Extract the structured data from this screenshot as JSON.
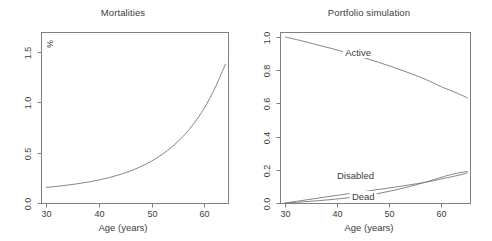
{
  "figure": {
    "background_color": "#ffffff",
    "axis_color": "#808080",
    "curve_color": "#787878",
    "text_color": "#3c3c3c"
  },
  "chart_data": [
    {
      "type": "line",
      "title": "Mortalities",
      "xlabel": "Age (years)",
      "ylabel": "%",
      "unit_label": "%",
      "xlim": [
        29,
        64.5
      ],
      "ylim": [
        0.0,
        1.7
      ],
      "grid": false,
      "legend": "none",
      "xticks": [
        30,
        40,
        50,
        60
      ],
      "xticklabels": [
        "30",
        "40",
        "50",
        "60"
      ],
      "yticks": [
        0.0,
        0.5,
        1.0,
        1.5
      ],
      "yticklabels": [
        "0.0",
        "0.5",
        "1.0",
        "1.5"
      ],
      "series": [
        {
          "name": "mortality",
          "x": [
            30,
            32,
            34,
            36,
            38,
            40,
            42,
            44,
            46,
            48,
            50,
            52,
            54,
            56,
            58,
            60,
            62,
            64
          ],
          "y": [
            0.155,
            0.165,
            0.178,
            0.192,
            0.209,
            0.229,
            0.253,
            0.283,
            0.319,
            0.363,
            0.417,
            0.483,
            0.564,
            0.664,
            0.789,
            0.944,
            1.14,
            1.38
          ]
        }
      ]
    },
    {
      "type": "line",
      "title": "Portfolio simulation",
      "xlabel": "Age (years)",
      "ylabel": "",
      "xlim": [
        29,
        65.5
      ],
      "ylim": [
        0.0,
        1.03
      ],
      "grid": false,
      "legend": "inline-annotations",
      "xticks": [
        30,
        40,
        50,
        60
      ],
      "xticklabels": [
        "30",
        "40",
        "50",
        "60"
      ],
      "yticks": [
        0.0,
        0.2,
        0.4,
        0.6,
        0.8,
        1.0
      ],
      "yticklabels": [
        "0.0",
        "0.2",
        "0.4",
        "0.6",
        "0.8",
        "1.0"
      ],
      "series": [
        {
          "name": "Active",
          "x": [
            30,
            33,
            36,
            39,
            42,
            45,
            48,
            51,
            54,
            57,
            60,
            62,
            64,
            65
          ],
          "y": [
            1.0,
            0.978,
            0.954,
            0.93,
            0.904,
            0.876,
            0.847,
            0.815,
            0.781,
            0.744,
            0.7,
            0.675,
            0.648,
            0.633
          ]
        },
        {
          "name": "Disabled",
          "x": [
            30,
            33,
            36,
            39,
            42,
            45,
            48,
            51,
            54,
            57,
            60,
            62,
            64,
            65
          ],
          "y": [
            0.0,
            0.014,
            0.028,
            0.042,
            0.055,
            0.068,
            0.082,
            0.095,
            0.11,
            0.125,
            0.145,
            0.158,
            0.172,
            0.182
          ]
        },
        {
          "name": "Dead",
          "x": [
            30,
            33,
            36,
            39,
            42,
            45,
            48,
            51,
            54,
            57,
            60,
            62,
            64,
            65
          ],
          "y": [
            0.0,
            0.006,
            0.013,
            0.021,
            0.031,
            0.043,
            0.058,
            0.077,
            0.1,
            0.126,
            0.155,
            0.172,
            0.185,
            0.19
          ]
        }
      ],
      "annotations": [
        {
          "text": "Active",
          "x": 44.0,
          "y": 0.905
        },
        {
          "text": "Disabled",
          "x": 43.5,
          "y": 0.165
        },
        {
          "text": "Dead",
          "x": 45.0,
          "y": 0.035
        }
      ]
    }
  ]
}
